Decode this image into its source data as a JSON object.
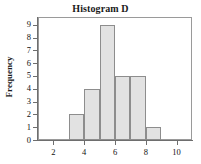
{
  "chart_data": {
    "type": "bar",
    "title": "Histogram D",
    "xlabel": "",
    "ylabel": "Frequency",
    "categories": [
      "3-4",
      "4-5",
      "5-6",
      "6-7",
      "7-8",
      "8-9"
    ],
    "bin_edges": [
      3,
      4,
      5,
      6,
      7,
      8,
      9
    ],
    "values": [
      2,
      4,
      9,
      5,
      5,
      1
    ],
    "xlim": [
      1,
      11
    ],
    "ylim": [
      0,
      9.6
    ],
    "x_ticks": [
      2,
      4,
      6,
      8,
      10
    ],
    "x_tick_labels": [
      "2",
      "4",
      "6",
      "8",
      "10"
    ],
    "y_ticks": [
      0,
      1,
      2,
      3,
      4,
      5,
      6,
      7,
      8,
      9
    ],
    "y_tick_labels": [
      "0",
      "1",
      "2",
      "3",
      "4",
      "5",
      "6",
      "7",
      "8",
      "9"
    ],
    "grid": false,
    "legend": false,
    "bar_fill_color": "#e2e2e2",
    "bar_border_color": "#8d8d8d",
    "axis_color": "#6e6e6e",
    "text_color": "#111111"
  }
}
